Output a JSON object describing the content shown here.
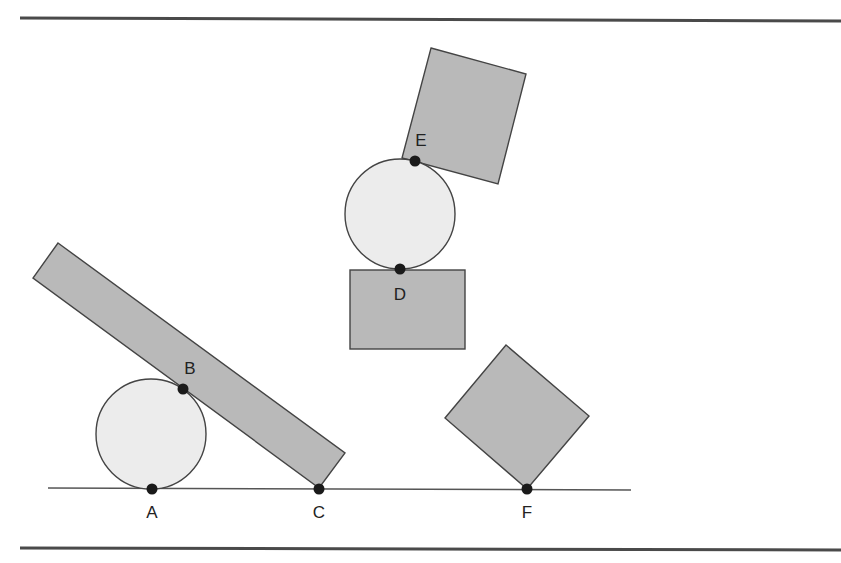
{
  "diagram": {
    "colors": {
      "block_fill": "#b9b9b9",
      "ball_fill": "#ececec",
      "stroke": "#444444",
      "point": "#1a1a1a",
      "rule": "#4a4a4a"
    },
    "points": [
      {
        "id": "A",
        "label": "A",
        "x": 152,
        "y": 489,
        "lx": 152,
        "ly": 518
      },
      {
        "id": "B",
        "label": "B",
        "x": 183,
        "y": 389,
        "lx": 190,
        "ly": 374
      },
      {
        "id": "C",
        "label": "C",
        "x": 319,
        "y": 489,
        "lx": 319,
        "ly": 518
      },
      {
        "id": "D",
        "label": "D",
        "x": 400,
        "y": 269,
        "lx": 400,
        "ly": 300
      },
      {
        "id": "E",
        "label": "E",
        "x": 415,
        "y": 161,
        "lx": 421,
        "ly": 146
      },
      {
        "id": "F",
        "label": "F",
        "x": 527,
        "y": 489,
        "lx": 527,
        "ly": 518
      }
    ]
  }
}
